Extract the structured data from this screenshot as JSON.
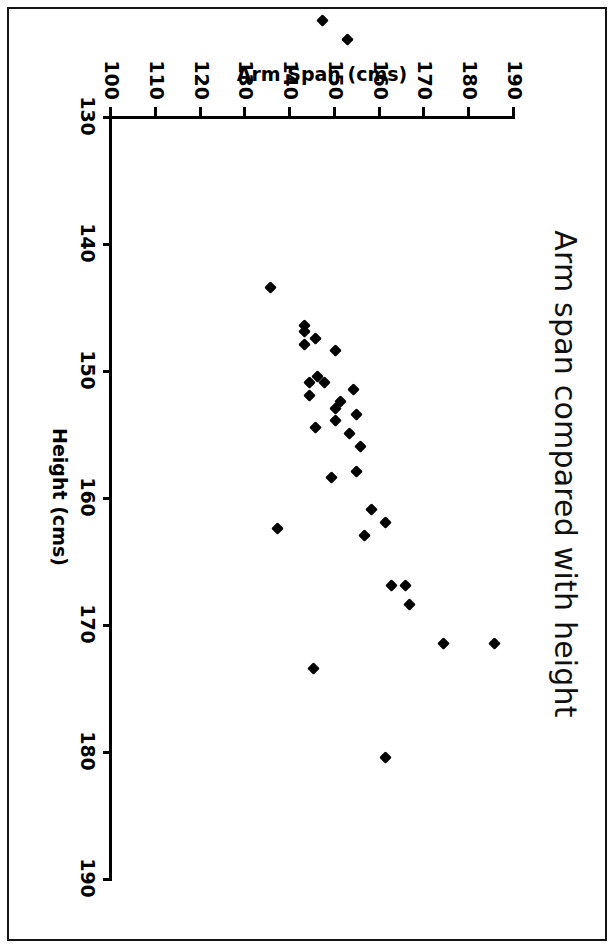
{
  "chart_data": {
    "type": "scatter",
    "title": "Arm span compared with height",
    "xlabel": "Height (cms)",
    "ylabel": "Arm Span (cms)",
    "xlim": [
      130,
      190
    ],
    "ylim": [
      100,
      190
    ],
    "xticks": [
      130,
      140,
      150,
      160,
      170,
      180,
      190
    ],
    "yticks": [
      100,
      110,
      120,
      130,
      140,
      150,
      160,
      170,
      180,
      190
    ],
    "grid": false,
    "legend": null,
    "marker": "filled-diamond",
    "marker_color": "#000000",
    "orientation_note": "Figure is printed sideways on the page, rotated 90 degrees clockwise.",
    "points": [
      {
        "x": 171.5,
        "y": 185.5
      },
      {
        "x": 171.5,
        "y": 174.0
      },
      {
        "x": 168.5,
        "y": 166.5
      },
      {
        "x": 167.0,
        "y": 165.5
      },
      {
        "x": 167.0,
        "y": 162.5
      },
      {
        "x": 180.5,
        "y": 161.0
      },
      {
        "x": 162.0,
        "y": 161.0
      },
      {
        "x": 161.0,
        "y": 158.0
      },
      {
        "x": 163.0,
        "y": 156.5
      },
      {
        "x": 156.0,
        "y": 155.5
      },
      {
        "x": 158.0,
        "y": 154.5
      },
      {
        "x": 153.5,
        "y": 154.5
      },
      {
        "x": 151.5,
        "y": 154.0
      },
      {
        "x": 155.0,
        "y": 153.0
      },
      {
        "x": 152.5,
        "y": 151.0
      },
      {
        "x": 154.0,
        "y": 150.0
      },
      {
        "x": 153.0,
        "y": 150.0
      },
      {
        "x": 148.5,
        "y": 150.0
      },
      {
        "x": 158.5,
        "y": 149.0
      },
      {
        "x": 151.0,
        "y": 147.5
      },
      {
        "x": 150.5,
        "y": 146.0
      },
      {
        "x": 154.5,
        "y": 145.5
      },
      {
        "x": 147.5,
        "y": 145.5
      },
      {
        "x": 173.5,
        "y": 145.0
      },
      {
        "x": 151.0,
        "y": 144.0
      },
      {
        "x": 152.0,
        "y": 144.0
      },
      {
        "x": 148.0,
        "y": 143.0
      },
      {
        "x": 147.0,
        "y": 143.0
      },
      {
        "x": 146.5,
        "y": 143.0
      },
      {
        "x": 162.5,
        "y": 137.0
      },
      {
        "x": 124.0,
        "y": 152.5
      },
      {
        "x": 122.5,
        "y": 147.0
      },
      {
        "x": 143.5,
        "y": 135.5
      }
    ]
  }
}
